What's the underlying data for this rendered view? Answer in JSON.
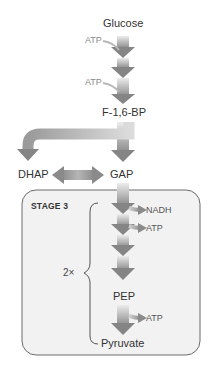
{
  "diagram": {
    "nodes": {
      "glucose": "Glucose",
      "f16bp": "F-1,6-BP",
      "dhap": "DHAP",
      "gap": "GAP",
      "pep": "PEP",
      "pyruvate": "Pyruvate"
    },
    "inputs": {
      "atp_1": "ATP",
      "atp_2": "ATP"
    },
    "stage3": {
      "label": "STAGE 3",
      "multiplier": "2×",
      "outputs": {
        "nadh": "NADH",
        "atp_1": "ATP",
        "atp_2": "ATP"
      }
    },
    "colors": {
      "arrow_dark": "#7a7a7a",
      "arrow_light": "#e0e0e0",
      "box_fill": "#f2f2f2",
      "box_stroke": "#6b6b6b",
      "text": "#333333",
      "atp_text": "#8a8a8a"
    }
  }
}
